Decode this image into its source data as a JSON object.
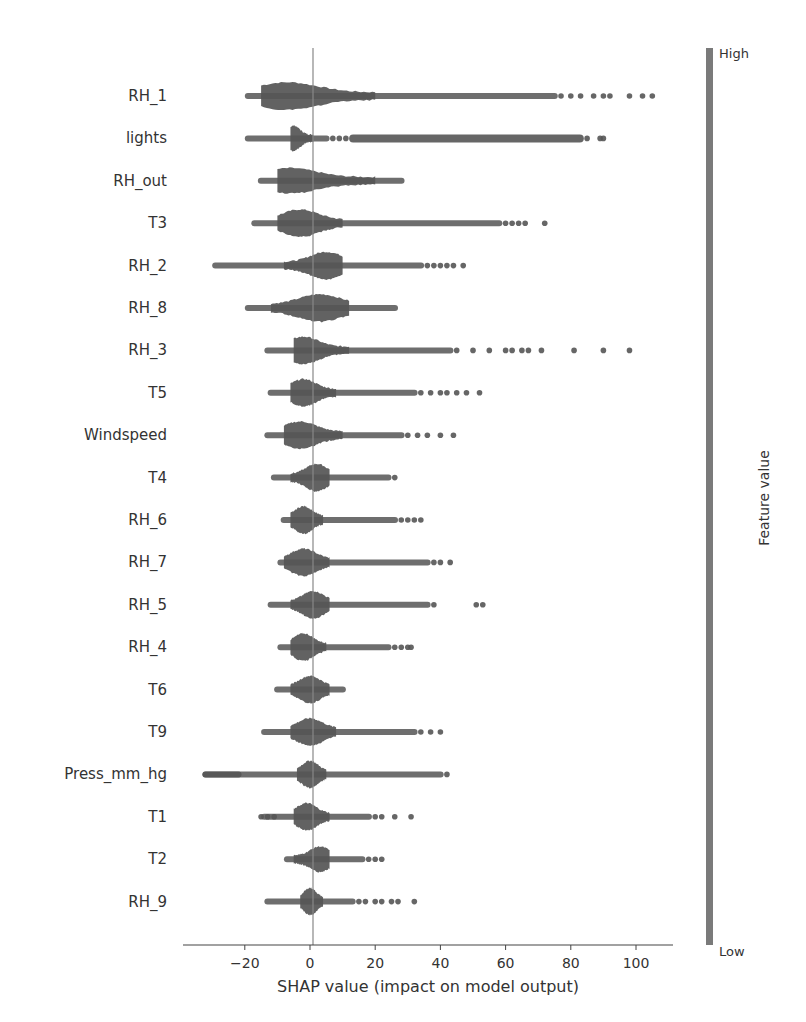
{
  "chart_data": {
    "type": "scatter",
    "subtype": "shap-beeswarm-summary",
    "title": "",
    "xlabel": "SHAP value (impact on model output)",
    "ylabel": "",
    "xlim": [
      -39,
      111
    ],
    "xticks": [
      -20,
      0,
      20,
      40,
      60,
      80,
      100
    ],
    "xtick_labels": [
      "−20",
      "0",
      "20",
      "40",
      "60",
      "80",
      "100"
    ],
    "grid": false,
    "zero_line": 0,
    "colorbar": {
      "title": "Feature value",
      "high_label": "High",
      "low_label": "Low",
      "color": "#7a7a7a"
    },
    "point_color": "#555555",
    "features": [
      {
        "name": "RH_1",
        "min": -20,
        "max": 106,
        "core": [
          -15,
          20
        ],
        "peak": -7,
        "width": 10,
        "outliers": [
          77,
          80,
          83,
          87,
          90,
          92,
          98,
          102,
          105
        ]
      },
      {
        "name": "lights",
        "min": -20,
        "max": 91,
        "core": [
          -6,
          1
        ],
        "peak": -5,
        "width": 9,
        "outliers": [
          7,
          9,
          11,
          85,
          89,
          90
        ],
        "dense_range": [
          12,
          84
        ]
      },
      {
        "name": "RH_out",
        "min": -16,
        "max": 29,
        "core": [
          -10,
          20
        ],
        "peak": -6,
        "width": 9,
        "outliers": []
      },
      {
        "name": "T3",
        "min": -18,
        "max": 72,
        "core": [
          -10,
          10
        ],
        "peak": -3,
        "width": 10,
        "outliers": [
          60,
          62,
          64,
          66,
          72
        ]
      },
      {
        "name": "RH_2",
        "min": -30,
        "max": 47,
        "core": [
          -8,
          10
        ],
        "peak": 5,
        "width": 10,
        "outliers": [
          36,
          38,
          40,
          42,
          44,
          47
        ]
      },
      {
        "name": "RH_8",
        "min": -20,
        "max": 27,
        "core": [
          -12,
          12
        ],
        "peak": 3,
        "width": 10,
        "outliers": []
      },
      {
        "name": "RH_3",
        "min": -14,
        "max": 98,
        "core": [
          -5,
          12
        ],
        "peak": -2,
        "width": 10,
        "outliers": [
          45,
          50,
          55,
          60,
          62,
          65,
          67,
          71,
          81,
          90,
          98
        ]
      },
      {
        "name": "T5",
        "min": -13,
        "max": 52,
        "core": [
          -6,
          8
        ],
        "peak": -2,
        "width": 10,
        "outliers": [
          34,
          37,
          40,
          42,
          45,
          48,
          52
        ]
      },
      {
        "name": "Windspeed",
        "min": -14,
        "max": 44,
        "core": [
          -8,
          10
        ],
        "peak": -3,
        "width": 10,
        "outliers": [
          30,
          33,
          36,
          40,
          44
        ]
      },
      {
        "name": "T4",
        "min": -12,
        "max": 26,
        "core": [
          -6,
          6
        ],
        "peak": 2,
        "width": 10,
        "outliers": [
          26
        ]
      },
      {
        "name": "RH_6",
        "min": -9,
        "max": 34,
        "core": [
          -6,
          4
        ],
        "peak": -2,
        "width": 10,
        "outliers": [
          28,
          30,
          32,
          34
        ]
      },
      {
        "name": "RH_7",
        "min": -10,
        "max": 43,
        "core": [
          -8,
          6
        ],
        "peak": -2,
        "width": 10,
        "outliers": [
          38,
          40,
          43
        ]
      },
      {
        "name": "RH_5",
        "min": -13,
        "max": 53,
        "core": [
          -6,
          6
        ],
        "peak": 1,
        "width": 10,
        "outliers": [
          38,
          51,
          53
        ]
      },
      {
        "name": "RH_4",
        "min": -10,
        "max": 31,
        "core": [
          -6,
          5
        ],
        "peak": -2,
        "width": 10,
        "outliers": [
          26,
          28,
          30,
          31
        ]
      },
      {
        "name": "T6",
        "min": -11,
        "max": 11,
        "core": [
          -6,
          6
        ],
        "peak": 0,
        "width": 10,
        "outliers": []
      },
      {
        "name": "T9",
        "min": -15,
        "max": 40,
        "core": [
          -6,
          8
        ],
        "peak": 0,
        "width": 10,
        "outliers": [
          34,
          37,
          40
        ]
      },
      {
        "name": "Press_mm_hg",
        "min": -33,
        "max": 42,
        "core": [
          -4,
          5
        ],
        "peak": 0,
        "width": 10,
        "outliers": [
          42
        ],
        "left_cluster": [
          -33,
          -21
        ]
      },
      {
        "name": "T1",
        "min": -15,
        "max": 31,
        "core": [
          -5,
          6
        ],
        "peak": -1,
        "width": 10,
        "outliers": [
          -15,
          -13,
          -11,
          20,
          22,
          26,
          31
        ]
      },
      {
        "name": "T2",
        "min": -8,
        "max": 22,
        "core": [
          -5,
          6
        ],
        "peak": 3,
        "width": 9,
        "outliers": [
          18,
          20,
          22
        ]
      },
      {
        "name": "RH_9",
        "min": -14,
        "max": 32,
        "core": [
          -3,
          4
        ],
        "peak": 0,
        "width": 10,
        "outliers": [
          15,
          17,
          20,
          22,
          25,
          27,
          32
        ]
      }
    ]
  }
}
